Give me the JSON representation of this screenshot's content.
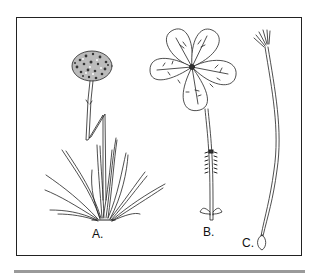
{
  "figure": {
    "panels": [
      {
        "id": "A",
        "label": "A.",
        "subject": "clumping plant with grass-like leaves and a globular flower head on a jointed stalk"
      },
      {
        "id": "B",
        "label": "B.",
        "subject": "single five-lobed flower with veined petals on a stalk with a hairy band and small bracts at base"
      },
      {
        "id": "C",
        "label": "C.",
        "subject": "long slender stalk with a tuft of filaments at the top and a bulb-like base"
      }
    ],
    "colors": {
      "line": "#222222",
      "frame": "#222222",
      "rule": "#9a9a9a",
      "background": "#ffffff"
    }
  }
}
